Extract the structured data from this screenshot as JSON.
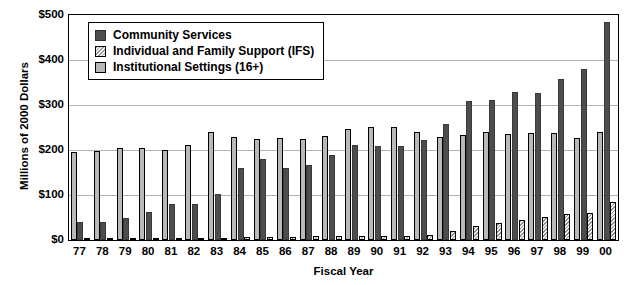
{
  "chart_data": {
    "type": "bar",
    "title": "",
    "xlabel": "Fiscal Year",
    "ylabel": "Millions of 2000 Dollars",
    "ylim": [
      0,
      500
    ],
    "ytick_labels": [
      "$500",
      "$400",
      "$300",
      "$200",
      "$100",
      "$0"
    ],
    "ytick_values": [
      500,
      400,
      300,
      200,
      100,
      0
    ],
    "grid": true,
    "legend_position": "upper-left",
    "categories": [
      "77",
      "78",
      "79",
      "80",
      "81",
      "82",
      "83",
      "84",
      "85",
      "86",
      "87",
      "88",
      "89",
      "90",
      "91",
      "92",
      "93",
      "94",
      "95",
      "96",
      "97",
      "98",
      "99",
      "00"
    ],
    "series": [
      {
        "name": "Institutional Settings (16+)",
        "color": "#b9b9b9",
        "values": [
          195,
          197,
          205,
          205,
          199,
          211,
          241,
          228,
          224,
          226,
          224,
          232,
          247,
          252,
          251,
          240,
          228,
          234,
          240,
          236,
          237,
          237,
          226,
          240
        ]
      },
      {
        "name": "Community Services",
        "color": "#4d4d4d",
        "values": [
          40,
          40,
          50,
          62,
          79,
          81,
          103,
          160,
          181,
          161,
          166,
          188,
          211,
          209,
          209,
          223,
          258,
          308,
          312,
          330,
          327,
          358,
          380,
          485
        ]
      },
      {
        "name": "Individual and Family Support (IFS)",
        "color": "#f2f2f2",
        "values": [
          3,
          3,
          3,
          4,
          4,
          5,
          5,
          6,
          6,
          7,
          8,
          8,
          9,
          10,
          10,
          12,
          20,
          32,
          38,
          45,
          52,
          58,
          60,
          85
        ]
      }
    ]
  },
  "legend": {
    "entries": [
      {
        "label": "Community Services",
        "swatch": "solid-dark-swatch"
      },
      {
        "label": "Individual and Family Support (IFS)",
        "swatch": "hatched-light-swatch"
      },
      {
        "label": "Institutional Settings (16+)",
        "swatch": "gray-outlined-swatch"
      }
    ]
  }
}
